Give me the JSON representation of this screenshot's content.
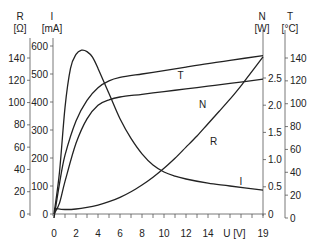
{
  "chart_data": {
    "type": "line",
    "title": "",
    "xlabel": "U [V]",
    "x_ticks": [
      0,
      2,
      4,
      6,
      8,
      10,
      12,
      14,
      19
    ],
    "xlim": [
      0,
      19
    ],
    "axes": [
      {
        "id": "R",
        "name": "R",
        "unit": "[Ω]",
        "ticks": [
          0,
          20,
          40,
          60,
          80,
          100,
          120,
          140
        ],
        "range": [
          0,
          140
        ],
        "side": "left-outer"
      },
      {
        "id": "I",
        "name": "I",
        "unit": "[mA]",
        "ticks": [
          0,
          100,
          200,
          300,
          400,
          500,
          600
        ],
        "range": [
          0,
          600
        ],
        "side": "left-inner"
      },
      {
        "id": "N",
        "name": "N",
        "unit": "[W]",
        "ticks": [
          0,
          0.5,
          1.0,
          1.5,
          2.0,
          2.5
        ],
        "range": [
          0,
          2.5
        ],
        "side": "right-inner"
      },
      {
        "id": "T",
        "name": "T",
        "unit": "[°C]",
        "ticks": [
          0,
          20,
          40,
          60,
          80,
          100,
          120,
          140
        ],
        "range": [
          0,
          140
        ],
        "side": "right-outer"
      }
    ],
    "series": [
      {
        "name": "I",
        "axis": "I",
        "x": [
          0,
          0.5,
          1,
          1.5,
          2,
          2.5,
          3,
          3.5,
          4,
          5,
          6,
          7,
          8,
          9,
          10,
          11,
          12,
          14,
          16,
          19
        ],
        "values": [
          0,
          150,
          380,
          520,
          570,
          585,
          580,
          560,
          520,
          430,
          340,
          270,
          215,
          175,
          150,
          135,
          125,
          110,
          100,
          85
        ]
      },
      {
        "name": "T",
        "axis": "T",
        "x": [
          0,
          0.5,
          1,
          2,
          3,
          4,
          5,
          6,
          8,
          10,
          12,
          14,
          16,
          19
        ],
        "values": [
          0,
          30,
          55,
          85,
          103,
          114,
          120,
          123,
          126,
          129,
          132,
          135,
          138,
          142
        ]
      },
      {
        "name": "N",
        "axis": "N",
        "x": [
          0,
          0.5,
          1,
          2,
          3,
          4,
          5,
          6,
          8,
          10,
          12,
          14,
          16,
          19
        ],
        "values": [
          0,
          0.2,
          0.6,
          1.3,
          1.75,
          2.0,
          2.1,
          2.15,
          2.2,
          2.25,
          2.3,
          2.35,
          2.4,
          2.48
        ]
      },
      {
        "name": "R",
        "axis": "R",
        "x": [
          0,
          1,
          2,
          3,
          4,
          5,
          6,
          7,
          8,
          9,
          10,
          11,
          12,
          13,
          14,
          15,
          16,
          17,
          18,
          19
        ],
        "values": [
          5,
          4,
          4.5,
          6,
          8,
          11,
          15,
          20,
          26,
          33,
          41,
          50,
          60,
          70,
          81,
          92,
          103,
          115,
          128,
          141
        ]
      }
    ],
    "curve_labels": [
      {
        "text": "T",
        "u": 11.5,
        "axis": "T",
        "v": 122
      },
      {
        "text": "N",
        "u": 13.5,
        "axis": "N",
        "v": 1.95
      },
      {
        "text": "R",
        "u": 14.5,
        "axis": "R",
        "v": 62
      },
      {
        "text": "I",
        "u": 17,
        "axis": "I",
        "v": 105
      }
    ],
    "grid": false,
    "legend": "none (curves labeled inline)"
  }
}
